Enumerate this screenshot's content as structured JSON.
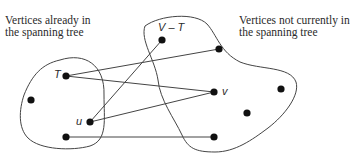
{
  "diagram": {
    "left_region_caption": [
      "Vertices already in",
      "the spanning tree"
    ],
    "right_region_caption": [
      "Vertices not currently in",
      "the spanning tree"
    ],
    "vertex_labels": {
      "T": "T",
      "V_minus_T": "V – T",
      "v": "v",
      "u": "u"
    },
    "colors": {
      "edge": "#444444",
      "vertex": "#111111",
      "boundary": "#444444"
    },
    "vertices": [
      {
        "id": "T",
        "x": 66,
        "y": 76,
        "region": "tree"
      },
      {
        "id": "left",
        "x": 31,
        "y": 100,
        "region": "tree"
      },
      {
        "id": "u",
        "x": 90,
        "y": 122,
        "region": "tree"
      },
      {
        "id": "bottom-left",
        "x": 66,
        "y": 137,
        "region": "tree"
      },
      {
        "id": "V-T",
        "x": 162,
        "y": 40,
        "region": "non-tree"
      },
      {
        "id": "top-right",
        "x": 219,
        "y": 49,
        "region": "non-tree"
      },
      {
        "id": "v",
        "x": 214,
        "y": 92,
        "region": "non-tree"
      },
      {
        "id": "right",
        "x": 281,
        "y": 89,
        "region": "non-tree"
      },
      {
        "id": "middle-right",
        "x": 247,
        "y": 113,
        "region": "non-tree"
      },
      {
        "id": "bottom-right",
        "x": 214,
        "y": 137,
        "region": "non-tree"
      }
    ],
    "edges": [
      {
        "from": "T",
        "to": "top-right"
      },
      {
        "from": "T",
        "to": "v"
      },
      {
        "from": "u",
        "to": "V-T"
      },
      {
        "from": "u",
        "to": "v"
      },
      {
        "from": "bottom-left",
        "to": "bottom-right"
      }
    ]
  }
}
